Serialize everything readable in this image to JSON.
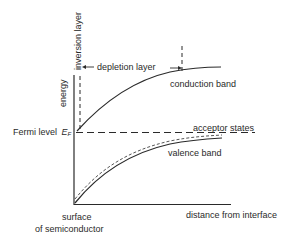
{
  "diagram": {
    "type": "band-diagram",
    "axes": {
      "y_label": "energy",
      "x_label": "distance from interface",
      "origin_label_line1": "surface",
      "origin_label_line2": "of semiconductor"
    },
    "labels": {
      "inversion_layer": "inversion layer",
      "depletion_layer": "depletion layer",
      "conduction_band": "conduction band",
      "fermi_level": "Fermi level",
      "fermi_symbol": "E",
      "fermi_subscript": "F",
      "acceptor_states": "acceptor states",
      "valence_band": "valence band"
    },
    "colors": {
      "line": "#2a2a2a",
      "background": "#ffffff"
    }
  }
}
